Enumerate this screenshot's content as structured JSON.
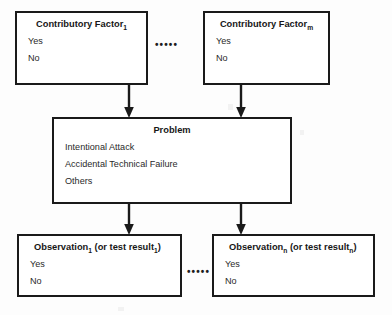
{
  "diagram": {
    "type": "flowchart",
    "title": "",
    "background_color": "#fdfdfd",
    "border_color": "#1a1a1a",
    "nodes": {
      "contributory_factor_1": {
        "title_main": "Contributory Factor",
        "title_sub": "1",
        "options": [
          "Yes",
          "No"
        ]
      },
      "contributory_factor_m": {
        "title_main": "Contributory Factor",
        "title_sub": "m",
        "options": [
          "Yes",
          "No"
        ]
      },
      "problem": {
        "title_main": "Problem",
        "title_sub": "",
        "options": [
          "Intentional Attack",
          "Accidental Technical Failure",
          "Others"
        ]
      },
      "observation_1": {
        "title_part1": "Observation",
        "title_sub1": "1",
        "title_part2": " (or test result",
        "title_sub2": "1",
        "title_part3": ")",
        "options": [
          "Yes",
          "No"
        ]
      },
      "observation_n": {
        "title_part1": "Observation",
        "title_sub1": "n",
        "title_part2": " (or test result",
        "title_sub2": "n",
        "title_part3": ")",
        "options": [
          "Yes",
          "No"
        ]
      }
    },
    "ellipses": {
      "top": "•••••",
      "bottom": "•••••"
    },
    "connectors": [
      {
        "from": "contributory_factor_1",
        "to": "problem",
        "style": "arrow-down"
      },
      {
        "from": "contributory_factor_m",
        "to": "problem",
        "style": "arrow-down"
      },
      {
        "from": "problem",
        "to": "observation_1",
        "style": "arrow-down"
      },
      {
        "from": "problem",
        "to": "observation_n",
        "style": "arrow-down"
      }
    ]
  }
}
